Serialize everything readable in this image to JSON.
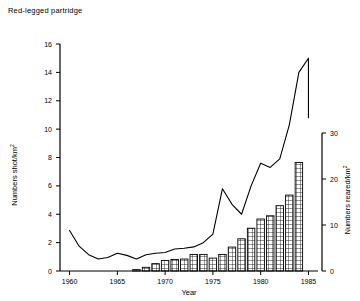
{
  "chart_data": {
    "type": "line",
    "title": "Red-legged partridge",
    "xlabel": "Year",
    "ylabel": "Numbers shot/km",
    "ylabel_sup": "2",
    "y2label": "Numbers reared/km",
    "y2label_sup": "2",
    "xlim": [
      1959,
      1986
    ],
    "ylim": [
      0,
      16
    ],
    "y2lim": [
      0,
      30
    ],
    "xticks": [
      1960,
      1965,
      1970,
      1975,
      1980,
      1985
    ],
    "xtick_labels": [
      "1960",
      "1965",
      "1970",
      "1975",
      "1980",
      "1985"
    ],
    "yticks": [
      0,
      2,
      4,
      6,
      8,
      10,
      12,
      14,
      16
    ],
    "ytick_labels": [
      "0",
      "2",
      "4",
      "6",
      "8",
      "10",
      "12",
      "14",
      "16"
    ],
    "y2ticks": [
      0,
      10,
      20,
      30
    ],
    "y2tick_labels": [
      "0",
      "10",
      "20",
      "30"
    ],
    "grid": false,
    "legend": "none",
    "series": [
      {
        "name": "Numbers shot/km2",
        "type": "line",
        "axis": "left",
        "x": [
          1960,
          1961,
          1962,
          1963,
          1964,
          1965,
          1966,
          1967,
          1968,
          1969,
          1970,
          1971,
          1972,
          1973,
          1974,
          1975,
          1976,
          1977,
          1978,
          1979,
          1980,
          1981,
          1982,
          1983,
          1984,
          1985
        ],
        "values": [
          2.85,
          1.75,
          1.15,
          0.85,
          0.95,
          1.25,
          1.1,
          0.85,
          1.15,
          1.25,
          1.3,
          1.55,
          1.6,
          1.7,
          2.0,
          2.6,
          5.8,
          4.7,
          4.0,
          6.0,
          7.6,
          7.3,
          7.9,
          10.3,
          14.0,
          15.0
        ]
      },
      {
        "name": "Numbers reared/km2",
        "type": "bar",
        "axis": "right",
        "x": [
          1967,
          1968,
          1969,
          1970,
          1971,
          1972,
          1973,
          1974,
          1975,
          1976,
          1977,
          1978,
          1979,
          1980,
          1981,
          1982,
          1983,
          1984
        ],
        "values": [
          0.3,
          0.8,
          1.6,
          2.3,
          2.5,
          2.6,
          3.6,
          3.6,
          2.8,
          3.6,
          5.2,
          7.0,
          9.3,
          11.3,
          12.0,
          14.2,
          16.5,
          23.6
        ]
      }
    ],
    "note_line_tail": [
      1985,
      10.8
    ],
    "bar_fill": "crosshatch-grid",
    "line_color": "#000000",
    "bar_edge_color": "#000000"
  }
}
